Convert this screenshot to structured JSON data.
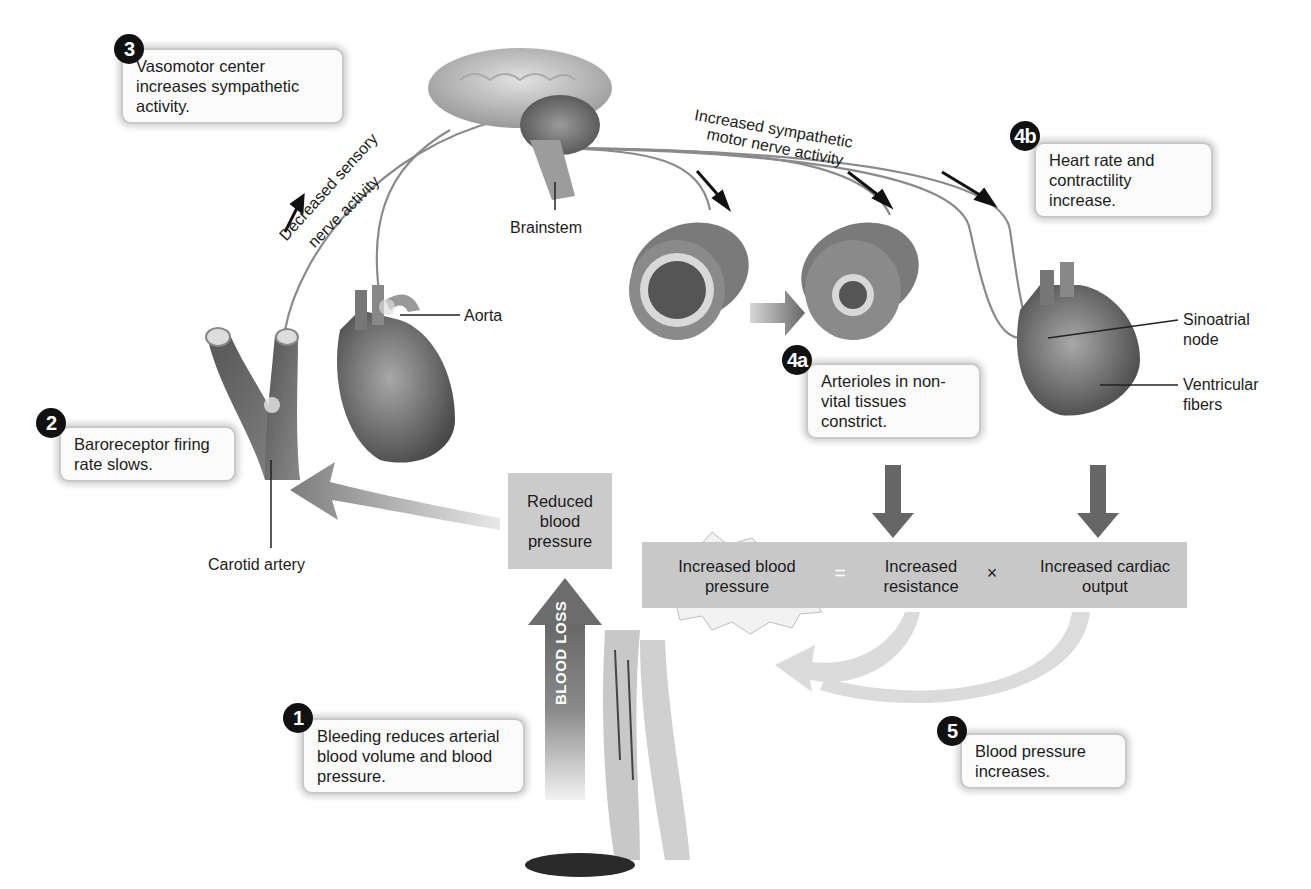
{
  "figure": {
    "colors": {
      "callout_bg": "#fbfbfb",
      "badge": "#111111",
      "bar": "#c8c8c8",
      "arrow": "#7a7a7a",
      "nerve": "#8a8a8a"
    }
  },
  "steps": [
    {
      "badge": "1",
      "text": "Bleeding reduces arterial blood volume and blood pressure."
    },
    {
      "badge": "2",
      "text": "Baroreceptor firing rate slows."
    },
    {
      "badge": "3",
      "text": "Vasomotor center increases sympathetic activity."
    },
    {
      "badge": "4a",
      "text": "Arterioles in non-vital tissues constrict."
    },
    {
      "badge": "4b",
      "text": "Heart rate and contractility increase."
    },
    {
      "badge": "5",
      "text": "Blood pressure increases."
    }
  ],
  "labels": {
    "brainstem": "Brainstem",
    "aorta": "Aorta",
    "carotid_artery": "Carotid artery",
    "sinoatrial_node": "Sinoatrial node",
    "ventricular_fibers": "Ventricular fibers",
    "decreased_sensory_line1": "Decreased sensory",
    "decreased_sensory_line2": "nerve activity",
    "increased_sympathetic_line1": "Increased sympathetic",
    "increased_sympathetic_line2": "motor nerve activity",
    "reduced_bp": "Reduced blood pressure",
    "blood_loss": "BLOOD LOSS"
  },
  "equation": {
    "result": "Increased blood pressure",
    "equals": "=",
    "term1": "Increased resistance",
    "times": "×",
    "term2": "Increased cardiac output"
  },
  "icons": [
    "brain-illustration",
    "heart-illustration",
    "carotid-artery-illustration",
    "arteriole-dilated-illustration",
    "arteriole-constricted-illustration",
    "legs-bleeding-illustration"
  ]
}
